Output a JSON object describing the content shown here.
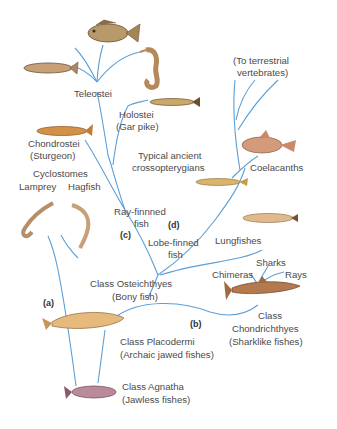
{
  "colors": {
    "branch": "#5b9fd6",
    "text": "#4a4a4a"
  },
  "labels": {
    "teleostei": "Teleostei",
    "holostei": "Holostei",
    "holostei_sub": "(Gar pike)",
    "chondrostei": "Chondrostei",
    "chondrostei_sub": "(Sturgeon)",
    "terrestrial_1": "(To terrestrial",
    "terrestrial_2": "vertebrates)",
    "typical_1": "Typical ancient",
    "typical_2": "crossopterygians",
    "coelacanths": "Coelacanths",
    "cyclostomes": "Cyclostomes",
    "lamprey": "Lamprey",
    "hagfish": "Hagfish",
    "ray_finned_1": "Ray-finnned",
    "ray_finned_2": "fish",
    "lobe_finned_1": "Lobe-finned",
    "lobe_finned_2": "fish",
    "lungfishes": "Lungfishes",
    "sharks": "Sharks",
    "chimeras": "Chimeras",
    "rays": "Rays",
    "osteichthyes_1": "Class Osteichthyes",
    "osteichthyes_2": "(Bony fish)",
    "chondrichthyes_1": "Class",
    "chondrichthyes_2": "Chondrichthyes",
    "chondrichthyes_3": "(Sharklike fishes)",
    "placodermi_1": "Class Placodermi",
    "placodermi_2": "(Archaic jawed fishes)",
    "agnatha_1": "Class Agnatha",
    "agnatha_2": "(Jawless fishes)"
  },
  "tags": {
    "a": "(a)",
    "b": "(b)",
    "c": "(c)",
    "d": "(d)"
  }
}
